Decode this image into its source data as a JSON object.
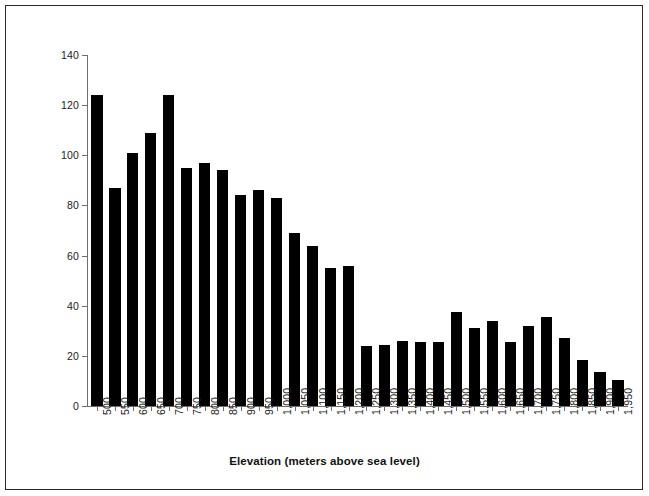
{
  "chart_data": {
    "type": "bar",
    "title": "",
    "xlabel": "Elevation (meters above sea level)",
    "ylabel": "Number of species",
    "categories": [
      "500",
      "550",
      "600",
      "650",
      "700",
      "750",
      "800",
      "850",
      "900",
      "950",
      "1,000",
      "1,050",
      "1,100",
      "1,150",
      "1,200",
      "1,250",
      "1,300",
      "1,350",
      "1,400",
      "1,450",
      "1,500",
      "1,550",
      "1,600",
      "1,650",
      "1,700",
      "1,750",
      "1,800",
      "1,850",
      "1,900",
      "1,950"
    ],
    "values": [
      124,
      87,
      101,
      109,
      124,
      95,
      97,
      94,
      84,
      86,
      83,
      69,
      64,
      55,
      56,
      24,
      24.5,
      26,
      25.5,
      25.5,
      37.5,
      31,
      34,
      25.5,
      32,
      35.5,
      27,
      18.5,
      13.5,
      10.5
    ],
    "ylim": [
      0,
      140
    ],
    "yticks": [
      0,
      20,
      40,
      60,
      80,
      100,
      120,
      140
    ],
    "ytick_labels": [
      "0",
      "20",
      "40",
      "60",
      "80",
      "100",
      "120",
      "140"
    ],
    "bar_color": "#000000",
    "axis_color": "#6e6e6e",
    "grid": false,
    "legend": null
  },
  "figure": {
    "border_color": "#2b2b2b",
    "background": "#ffffff"
  }
}
